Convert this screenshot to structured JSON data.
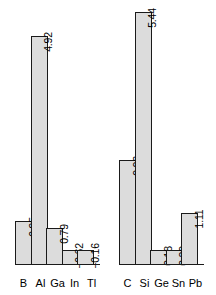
{
  "chart_data": {
    "type": "bar",
    "title": "",
    "subtitle": "",
    "xlabel": "",
    "ylabel": "",
    "grid": false,
    "legend": null,
    "baseline": 0,
    "ylim": [
      -0.62,
      5.44
    ],
    "groups": [
      {
        "name": "group-13",
        "categories": [
          "B",
          "Al",
          "Ga",
          "In",
          "Tl"
        ],
        "values": [
          0.95,
          4.92,
          0.79,
          -0.62,
          -0.16
        ],
        "labels": [
          "0.95",
          "4.92",
          "0.79",
          "−0.62",
          "−0.16"
        ]
      },
      {
        "name": "group-14",
        "categories": [
          "C",
          "Si",
          "Ge",
          "Sn",
          "Pb"
        ],
        "values": [
          2.26,
          5.44,
          0.18,
          0.32,
          1.11
        ],
        "labels": [
          "2.26",
          "5.44",
          "0.18",
          "0.32",
          "1.11"
        ]
      }
    ],
    "colors": {
      "bar_fill": "#dcdcdc",
      "bar_stroke": "#1a1a1a",
      "text": "#000000",
      "background": "#ffffff"
    }
  }
}
